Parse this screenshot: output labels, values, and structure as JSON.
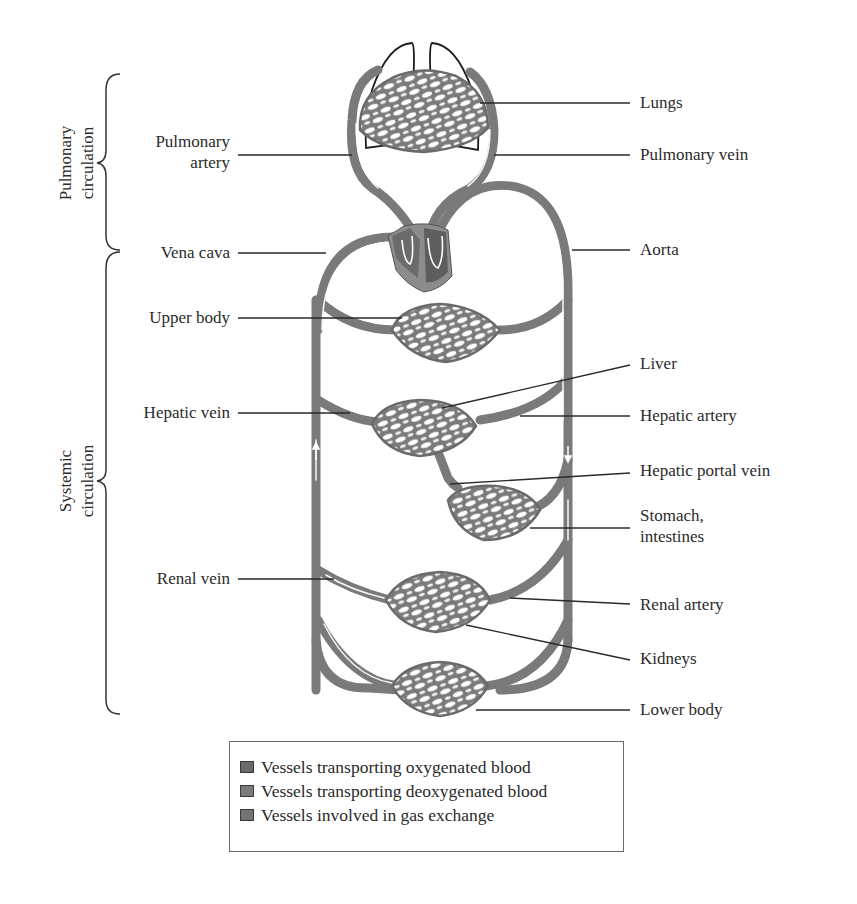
{
  "diagram": {
    "colors": {
      "vessel": "#7a7a7a",
      "vessel_dark": "#5e5e5e",
      "heart_right": "#6b6b6b",
      "heart_left": "#8c8c8c",
      "lung_outline": "#1e1e1e",
      "leader_line": "#2a2a2a"
    },
    "brackets": {
      "pulmonary": "Pulmonary circulation",
      "pulmonary_line1": "Pulmonary",
      "pulmonary_line2": "circulation",
      "systemic_line1": "Systemic",
      "systemic_line2": "circulation"
    },
    "left_labels": {
      "pulmonary_artery_1": "Pulmonary",
      "pulmonary_artery_2": "artery",
      "vena_cava": "Vena cava",
      "upper_body": "Upper body",
      "hepatic_vein": "Hepatic vein",
      "renal_vein": "Renal vein"
    },
    "right_labels": {
      "lungs": "Lungs",
      "pulmonary_vein": "Pulmonary vein",
      "aorta": "Aorta",
      "liver": "Liver",
      "hepatic_artery": "Hepatic artery",
      "hepatic_portal_vein": "Hepatic portal vein",
      "stomach_1": "Stomach,",
      "stomach_2": "intestines",
      "renal_artery": "Renal artery",
      "kidneys": "Kidneys",
      "lower_body": "Lower body"
    },
    "legend": {
      "items": [
        {
          "label": "Vessels transporting oxygenated blood",
          "color": "#6a6a6a"
        },
        {
          "label": "Vessels transporting deoxygenated blood",
          "color": "#7c7c7c"
        },
        {
          "label": "Vessels involved in gas exchange",
          "color": "#737373"
        }
      ]
    }
  }
}
